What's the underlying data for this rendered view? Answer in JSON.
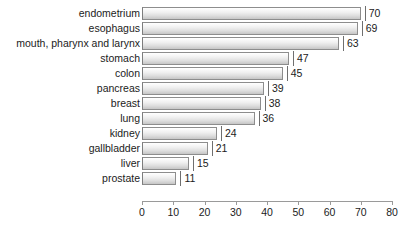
{
  "chart_data": {
    "type": "bar",
    "orientation": "horizontal",
    "title": "",
    "subtitle": "",
    "xlabel": "",
    "ylabel": "",
    "xlim": [
      0,
      80
    ],
    "xticks": [
      0,
      10,
      20,
      30,
      40,
      50,
      60,
      70,
      80
    ],
    "xtick_labels": [
      "0",
      "10",
      "20",
      "30",
      "40",
      "50",
      "60",
      "70",
      "80"
    ],
    "grid": false,
    "legend": null,
    "value_labels_shown": true,
    "categories": [
      "endometrium",
      "esophagus",
      "mouth, pharynx and larynx",
      "stomach",
      "colon",
      "pancreas",
      "breast",
      "lung",
      "kidney",
      "gallbladder",
      "liver",
      "prostate"
    ],
    "values": [
      70,
      69,
      63,
      47,
      45,
      39,
      38,
      36,
      24,
      21,
      15,
      11
    ],
    "value_label_texts": [
      "70",
      "69",
      "63",
      "47",
      "45",
      "39",
      "38",
      "36",
      "24",
      "21",
      "15",
      "11"
    ],
    "bars": [
      {
        "label": "endometrium",
        "value": 70,
        "value_text": "70"
      },
      {
        "label": "esophagus",
        "value": 69,
        "value_text": "69"
      },
      {
        "label": "mouth, pharynx and larynx",
        "value": 63,
        "value_text": "63"
      },
      {
        "label": "stomach",
        "value": 47,
        "value_text": "47"
      },
      {
        "label": "colon",
        "value": 45,
        "value_text": "45"
      },
      {
        "label": "pancreas",
        "value": 39,
        "value_text": "39"
      },
      {
        "label": "breast",
        "value": 38,
        "value_text": "38"
      },
      {
        "label": "lung",
        "value": 36,
        "value_text": "36"
      },
      {
        "label": "kidney",
        "value": 24,
        "value_text": "24"
      },
      {
        "label": "gallbladder",
        "value": 21,
        "value_text": "21"
      },
      {
        "label": "liver",
        "value": 15,
        "value_text": "15"
      },
      {
        "label": "prostate",
        "value": 11,
        "value_text": "11"
      }
    ],
    "colors": {
      "background": "#ffffff",
      "bar_fill_light": "#ffffff",
      "bar_fill_dark": "#c6c6c6",
      "bar_border": "#8d8d8d",
      "axis": "#9a9a9a",
      "text": "#1b1b1b"
    }
  }
}
